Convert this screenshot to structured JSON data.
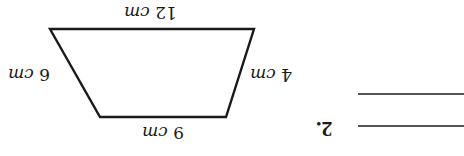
{
  "orientation": "rotated-180",
  "question": {
    "number": "2."
  },
  "figure": {
    "shape": "trapezoid",
    "stroke_color": "#1a1a1a",
    "sides": {
      "top": {
        "value": "12",
        "unit": "cm"
      },
      "left": {
        "value": "6",
        "unit": "cm"
      },
      "right": {
        "value": "4",
        "unit": "cm"
      },
      "bottom": {
        "value": "9",
        "unit": "cm"
      }
    }
  },
  "answer": {
    "line_count": 2,
    "line_color": "#555555"
  }
}
